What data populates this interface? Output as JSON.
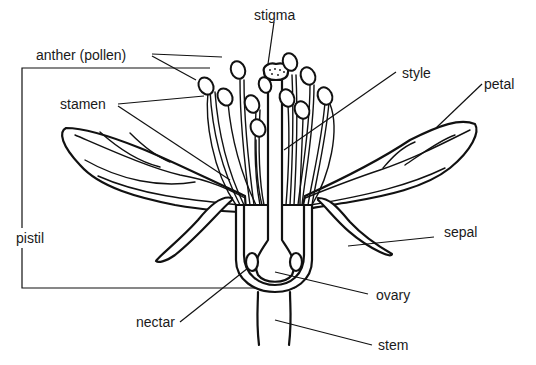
{
  "diagram": {
    "ink_color": "#111111",
    "background": "#ffffff",
    "labels": {
      "anther": "anther (pollen)",
      "stigma": "stigma",
      "style": "style",
      "petal": "petal",
      "stamen": "stamen",
      "sepal": "sepal",
      "pistil": "pistil",
      "ovary": "ovary",
      "nectar": "nectar",
      "stem": "stem"
    }
  }
}
